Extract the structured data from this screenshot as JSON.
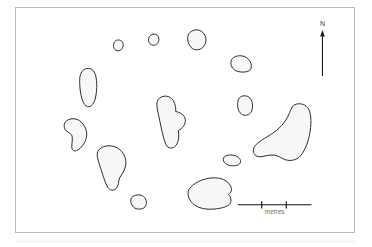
{
  "figure": {
    "kind": "archaeological-site-plan",
    "frame": {
      "border_color": "#b9b9b9",
      "background_color": "#ffffff"
    }
  },
  "style": {
    "stone_fill": "#f7f7f7",
    "stone_stroke": "#2b2b2b",
    "scale_color": "#111111",
    "label_color": "#6d6d6d",
    "north_color": "#1a1a1a"
  },
  "north_arrow": {
    "label": "N",
    "direction": "up",
    "x": 307,
    "y_top": 22,
    "y_bottom": 68
  },
  "scale_bar": {
    "label": "metres",
    "x_start": 242,
    "x_end": 322,
    "y": 192,
    "tick_count": 2,
    "tick_positions": [
      268,
      295
    ],
    "segments": 3
  },
  "stones": [
    {
      "id": "stone-01",
      "name": "north-west-upper-stone",
      "path": "M 296 104 C 300 96 310 94 317 99 C 324 104 325 115 320 122 C 315 129 305 131 299 126 C 293 121 292 112 296 104 Z"
    },
    {
      "id": "stone-02",
      "name": "north-stone-small",
      "path": "M 402 86 C 407 78 418 76 425 82 C 432 88 432 100 426 107 C 420 114 410 114 404 108 C 398 102 397 94 402 86 Z"
    },
    {
      "id": "stone-03",
      "name": "north-north-east-stone",
      "path": "M 520 78 C 528 66 546 62 558 70 C 572 79 576 98 568 112 C 560 126 542 130 531 122 C 519 113 513 92 520 78 Z"
    },
    {
      "id": "stone-04",
      "name": "north-east-stone",
      "path": "M 652 152 C 662 142 682 141 695 150 C 708 159 712 176 706 186 C 698 196 668 195 657 186 C 646 177 644 160 652 152 Z"
    },
    {
      "id": "stone-05",
      "name": "west-north-west-tall-stone",
      "path": "M 196 196 C 204 180 222 178 232 188 C 243 199 246 232 241 262 C 237 289 226 300 215 297 C 203 293 196 272 193 244 C 191 221 191 206 196 196 Z"
    },
    {
      "id": "stone-06",
      "name": "east-small-stone",
      "path": "M 672 272 C 680 262 696 262 705 272 C 714 282 715 304 707 315 C 699 326 683 326 675 316 C 666 305 665 282 672 272 Z"
    },
    {
      "id": "stone-07",
      "name": "central-notched-stone",
      "path": "M 426 280 C 432 266 452 261 465 270 C 477 278 482 296 481 312 C 494 314 508 322 510 336 C 512 350 501 364 489 369 C 492 386 490 404 482 414 C 472 426 458 424 452 412 C 444 395 437 360 431 330 C 426 307 422 292 426 280 Z"
    },
    {
      "id": "stone-08",
      "name": "east-large-boot-stone",
      "path": "M 838 292 C 854 284 874 290 882 306 C 890 322 890 352 884 382 C 878 412 866 438 852 450 C 838 461 820 462 806 455 C 792 448 784 442 768 443 C 752 444 740 450 730 448 C 718 446 712 434 716 422 C 720 410 740 398 766 382 C 792 366 812 344 822 320 C 828 306 832 295 838 292 Z"
    },
    {
      "id": "stone-09",
      "name": "west-hook-stone",
      "path": "M 148 344 C 158 332 178 330 192 340 C 208 352 216 372 212 390 C 208 408 196 422 186 428 C 176 434 168 430 168 418 C 168 404 172 392 168 384 C 164 376 152 374 148 366 C 144 358 144 350 148 344 Z"
    },
    {
      "id": "stone-10",
      "name": "south-west-large-stone",
      "path": "M 246 432 C 256 414 286 410 306 422 C 326 434 334 456 330 476 C 326 494 316 504 312 512 C 308 522 310 536 302 544 C 294 552 282 550 276 540 C 268 526 260 498 252 474 C 246 456 242 442 246 432 Z"
    },
    {
      "id": "stone-11",
      "name": "centre-east-sliver-stone",
      "path": "M 628 448 C 638 440 660 442 670 450 C 680 458 678 470 666 474 C 652 478 634 474 628 466 C 623 459 623 453 628 448 Z"
    },
    {
      "id": "stone-12",
      "name": "south-central-stone",
      "path": "M 520 548 C 532 528 562 514 590 512 C 618 510 638 520 646 536 C 652 548 648 556 640 562 C 648 570 650 582 644 590 C 636 600 616 604 596 606 C 574 608 552 604 538 594 C 522 582 514 562 520 548 Z"
    },
    {
      "id": "stone-13",
      "name": "south-west-small-stone",
      "path": "M 348 572 C 356 562 374 560 384 568 C 394 576 396 592 388 600 C 380 608 362 608 354 600 C 346 592 343 580 348 572 Z"
    }
  ]
}
